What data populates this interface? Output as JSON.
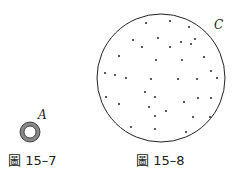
{
  "figures": [
    {
      "id": "15-7",
      "caption": "圖 15–7",
      "label": "A",
      "ring": {
        "cx": 30,
        "cy": 132,
        "r_outer": 10,
        "r_inner": 6,
        "fill": "#888888",
        "stroke": "#222222"
      }
    },
    {
      "id": "15-8",
      "caption": "圖 15–8",
      "label": "C",
      "circle": {
        "cx": 161,
        "cy": 78,
        "r": 64,
        "stroke": "#222222"
      },
      "dots": [
        [
          146,
          23
        ],
        [
          170,
          21
        ],
        [
          189,
          27
        ],
        [
          133,
          40
        ],
        [
          158,
          38
        ],
        [
          142,
          47
        ],
        [
          170,
          47
        ],
        [
          181,
          42
        ],
        [
          191,
          44
        ],
        [
          195,
          39
        ],
        [
          119,
          56
        ],
        [
          156,
          60
        ],
        [
          182,
          60
        ],
        [
          204,
          57
        ],
        [
          105,
          73
        ],
        [
          115,
          75
        ],
        [
          126,
          78
        ],
        [
          151,
          79
        ],
        [
          178,
          79
        ],
        [
          197,
          79
        ],
        [
          211,
          71
        ],
        [
          217,
          78
        ],
        [
          145,
          92
        ],
        [
          155,
          97
        ],
        [
          106,
          97
        ],
        [
          198,
          98
        ],
        [
          211,
          98
        ],
        [
          184,
          102
        ],
        [
          119,
          104
        ],
        [
          149,
          107
        ],
        [
          166,
          111
        ],
        [
          155,
          116
        ],
        [
          193,
          117
        ],
        [
          210,
          117
        ],
        [
          131,
          127
        ],
        [
          155,
          129
        ],
        [
          186,
          132
        ]
      ]
    }
  ]
}
